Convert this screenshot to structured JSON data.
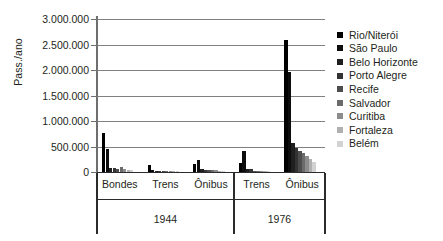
{
  "chart_data": {
    "type": "bar",
    "title": "",
    "xlabel": "",
    "ylabel": "Pass./ano",
    "ylim": [
      0,
      3000000
    ],
    "ytick_labels": [
      "3.000.000",
      "2.500.000",
      "2.000.000",
      "1.500.000",
      "1.000.000",
      "500.000",
      "0"
    ],
    "ytick_values": [
      3000000,
      2500000,
      2000000,
      1500000,
      1000000,
      500000,
      0
    ],
    "grid": true,
    "legend_position": "right",
    "series": [
      {
        "name": "Rio/Niterói",
        "color": "#000000",
        "values": [
          770000,
          130000,
          160000,
          170000,
          2580000
        ]
      },
      {
        "name": "São Paulo",
        "color": "#0d0d0d",
        "values": [
          460000,
          40000,
          230000,
          420000,
          1970000
        ]
      },
      {
        "name": "Belo Horizonte",
        "color": "#1f1f1f",
        "values": [
          80000,
          12000,
          50000,
          60000,
          560000
        ]
      },
      {
        "name": "Porto Alegre",
        "color": "#333333",
        "values": [
          70000,
          20000,
          35000,
          55000,
          470000
        ]
      },
      {
        "name": "Recife",
        "color": "#4d4d4d",
        "values": [
          55000,
          18000,
          30000,
          20000,
          420000
        ]
      },
      {
        "name": "Salvador",
        "color": "#6b6b6b",
        "values": [
          90000,
          15000,
          45000,
          12000,
          370000
        ]
      },
      {
        "name": "Curitiba",
        "color": "#8c8c8c",
        "values": [
          60000,
          10000,
          40000,
          8000,
          310000
        ]
      },
      {
        "name": "Fortaleza",
        "color": "#b0b0b0",
        "values": [
          45000,
          8000,
          25000,
          6000,
          250000
        ]
      },
      {
        "name": "Belém",
        "color": "#d2d2d2",
        "values": [
          30000,
          6000,
          20000,
          5000,
          190000
        ]
      }
    ],
    "categories": [
      "Bondes",
      "Trens",
      "Ônibus",
      "Trens",
      "Ônibus"
    ],
    "group_labels": [
      "1944",
      "1976"
    ],
    "group_spans": [
      3,
      2
    ]
  },
  "legend": {
    "items": [
      {
        "label": "Rio/Niterói"
      },
      {
        "label": "São Paulo"
      },
      {
        "label": "Belo Horizonte"
      },
      {
        "label": "Porto Alegre"
      },
      {
        "label": "Recife"
      },
      {
        "label": "Salvador"
      },
      {
        "label": "Curitiba"
      },
      {
        "label": "Fortaleza"
      },
      {
        "label": "Belém"
      }
    ]
  }
}
